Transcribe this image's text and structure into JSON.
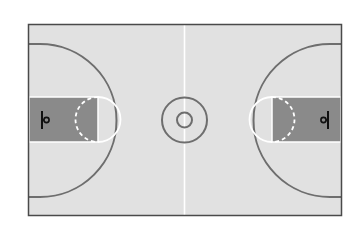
{
  "diagram": {
    "colors": {
      "background": "#ffffff",
      "floor": "#e1e1e1",
      "key_paint": "#8a8a8a",
      "court_lines": "#6e6e6e",
      "white_lines": "#ffffff",
      "outline": "#4a4a4a",
      "hoop": "#111111"
    },
    "elements": [
      "court-boundary",
      "half-court-line",
      "center-circle",
      "center-inner-circle",
      "left-three-point-arc",
      "right-three-point-arc",
      "left-key",
      "right-key",
      "left-free-throw-circle",
      "right-free-throw-circle",
      "left-basket",
      "right-basket"
    ]
  }
}
